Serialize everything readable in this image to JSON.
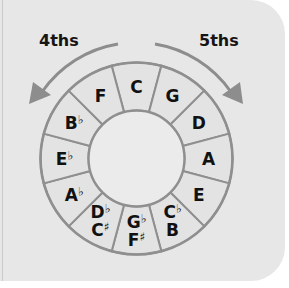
{
  "diagram": {
    "directions": {
      "left": {
        "label": "4ths",
        "direction": "counter-clockwise"
      },
      "right": {
        "label": "5ths",
        "direction": "clockwise"
      }
    },
    "segments": [
      {
        "position": 0,
        "lines": [
          "C"
        ]
      },
      {
        "position": 1,
        "lines": [
          "G"
        ]
      },
      {
        "position": 2,
        "lines": [
          "D"
        ]
      },
      {
        "position": 3,
        "lines": [
          "A"
        ]
      },
      {
        "position": 4,
        "lines": [
          "E"
        ]
      },
      {
        "position": 5,
        "lines": [
          "C♭",
          "B"
        ]
      },
      {
        "position": 6,
        "lines": [
          "G♭",
          "F♯"
        ]
      },
      {
        "position": 7,
        "lines": [
          "D♭",
          "C♯"
        ]
      },
      {
        "position": 8,
        "lines": [
          "A♭"
        ]
      },
      {
        "position": 9,
        "lines": [
          "E♭"
        ]
      },
      {
        "position": 10,
        "lines": [
          "B♭"
        ]
      },
      {
        "position": 11,
        "lines": [
          "F"
        ]
      }
    ],
    "colors": {
      "panel": "#e7e7e7",
      "segment_fill": "#e3e3e3",
      "center_fill": "#ebebeb",
      "stroke": "#8f8f8f",
      "arrow": "#8d8d8d",
      "text": "#111111"
    }
  }
}
